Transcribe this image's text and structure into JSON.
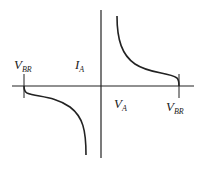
{
  "diagram": {
    "type": "iv-characteristic",
    "colors": {
      "stroke": "#222222",
      "background": "#ffffff"
    },
    "labels": {
      "ia": {
        "main": "I",
        "sub": "A"
      },
      "va": {
        "main": "V",
        "sub": "A"
      },
      "vbr_left": {
        "main": "V",
        "sub": "BR"
      },
      "vbr_right": {
        "main": "V",
        "sub": "BR"
      }
    }
  }
}
